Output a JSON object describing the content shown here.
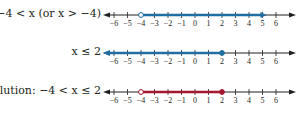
{
  "colors": {
    "axis": "#231f20",
    "row1_highlight": "#1f6fa3",
    "row2_highlight": "#1f6fa3",
    "solution_highlight": "#a3172f"
  },
  "rows": [
    {
      "label": "−4 < x (or x > −4)",
      "endpoint_left": -4,
      "left_closed": false,
      "right": "infinity",
      "color_key": "row1_highlight"
    },
    {
      "label": "x ≤ 2",
      "endpoint_right": 2,
      "right_closed": true,
      "left": "-infinity",
      "color_key": "row2_highlight"
    },
    {
      "label": "Solution:  −4 < x ≤ 2",
      "endpoint_left": -4,
      "left_closed": false,
      "endpoint_right": 2,
      "right_closed": true,
      "color_key": "solution_highlight"
    }
  ],
  "axis": {
    "ticks": [
      "−6",
      "−5",
      "−4",
      "−3",
      "−2",
      "−1",
      "0",
      "1",
      "2",
      "3",
      "4",
      "5",
      "6"
    ]
  },
  "chart_data": {
    "type": "number_line",
    "title": "",
    "xlim": [
      -6,
      6
    ],
    "tick_labels": [
      -6,
      -5,
      -4,
      -3,
      -2,
      -1,
      0,
      1,
      2,
      3,
      4,
      5,
      6
    ],
    "series": [
      {
        "name": "-4 < x (or x > -4)",
        "interval": [
          -4,
          "inf"
        ],
        "left_open": true,
        "color": "#1f6fa3"
      },
      {
        "name": "x ≤ 2",
        "interval": [
          "-inf",
          2
        ],
        "right_closed": true,
        "color": "#1f6fa3"
      },
      {
        "name": "Solution: -4 < x ≤ 2",
        "interval": [
          -4,
          2
        ],
        "left_open": true,
        "right_closed": true,
        "color": "#a3172f"
      }
    ]
  }
}
